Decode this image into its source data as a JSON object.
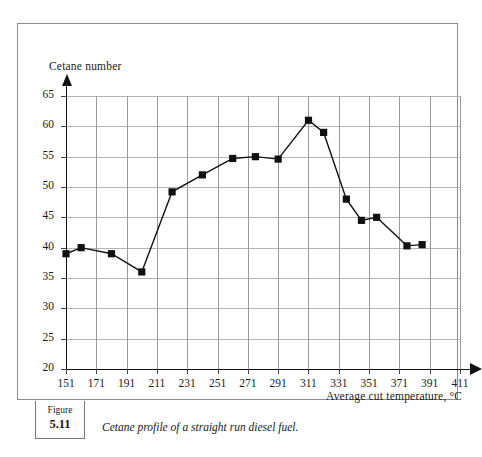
{
  "figure": {
    "word": "Figure",
    "number": "5.11",
    "caption": "Cetane profile of a straight run diesel fuel."
  },
  "chart_data": {
    "type": "line",
    "title": "",
    "xlabel": "Average cut temperature, °C",
    "ylabel": "Cetane number",
    "x": [
      151,
      171,
      191,
      211,
      231,
      251,
      271,
      291,
      311,
      331,
      351,
      371,
      391
    ],
    "x_ticks": [
      151,
      171,
      191,
      211,
      231,
      251,
      271,
      291,
      311,
      331,
      351,
      371,
      391,
      411
    ],
    "y_ticks": [
      20,
      25,
      30,
      35,
      40,
      45,
      50,
      55,
      60,
      65
    ],
    "xlim": [
      151,
      411
    ],
    "ylim": [
      20,
      65
    ],
    "grid": true,
    "legend": "none",
    "marker": "square",
    "series": [
      {
        "name": "Cetane number",
        "points": [
          {
            "x": 151,
            "y": 39.0
          },
          {
            "x": 161,
            "y": 40.0
          },
          {
            "x": 181,
            "y": 39.0
          },
          {
            "x": 201,
            "y": 36.0
          },
          {
            "x": 221,
            "y": 49.2
          },
          {
            "x": 241,
            "y": 52.0
          },
          {
            "x": 261,
            "y": 54.7
          },
          {
            "x": 276,
            "y": 55.0
          },
          {
            "x": 291,
            "y": 54.6
          },
          {
            "x": 311,
            "y": 61.0
          },
          {
            "x": 321,
            "y": 59.0
          },
          {
            "x": 336,
            "y": 48.0
          },
          {
            "x": 346,
            "y": 44.5
          },
          {
            "x": 356,
            "y": 45.0
          },
          {
            "x": 376,
            "y": 40.3
          },
          {
            "x": 386,
            "y": 40.5
          }
        ]
      }
    ]
  },
  "colors": {
    "line": "#111111",
    "marker": "#111111",
    "grid": "#9a9a9a",
    "axis": "#111111",
    "frame": "#8d8d8d"
  }
}
